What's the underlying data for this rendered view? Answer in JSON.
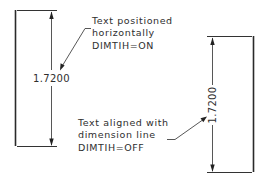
{
  "left_figure": {
    "dimension_value": "1.7200",
    "text_orientation": "horizontal",
    "note_lines": [
      "Text positioned",
      "horizontally",
      "DIMTIH=ON"
    ]
  },
  "right_figure": {
    "dimension_value": "1.7200",
    "text_orientation": "aligned",
    "note_lines": [
      "Text aligned with",
      "dimension line",
      "DIMTIH=OFF"
    ]
  },
  "colors": {
    "line": "#333333",
    "text": "#2e2e2e",
    "background": "#ffffff"
  }
}
